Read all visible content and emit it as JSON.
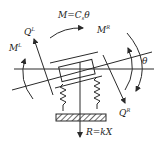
{
  "diagram": {
    "labels": {
      "moment_spring": "M=C",
      "moment_spring_sub": "s",
      "moment_spring_theta": "θ",
      "shear_left": "Q",
      "shear_left_sup": "L",
      "shear_right": "Q",
      "shear_right_sup": "R",
      "moment_left": "M",
      "moment_left_sup": "L",
      "moment_right": "M",
      "moment_right_sup": "R",
      "rotation": "θ",
      "reaction": "R=kX"
    },
    "components": [
      "horizontal-axis",
      "tilted-beam",
      "block",
      "left-spring",
      "right-spring",
      "ground",
      "reaction-arrow",
      "shear-left-arrow",
      "shear-right-arrow",
      "moment-left-arrow",
      "moment-right-arrows",
      "spring-moment-arrow"
    ],
    "colors": {
      "line": "#2a2a2a",
      "background": "#ffffff"
    }
  }
}
